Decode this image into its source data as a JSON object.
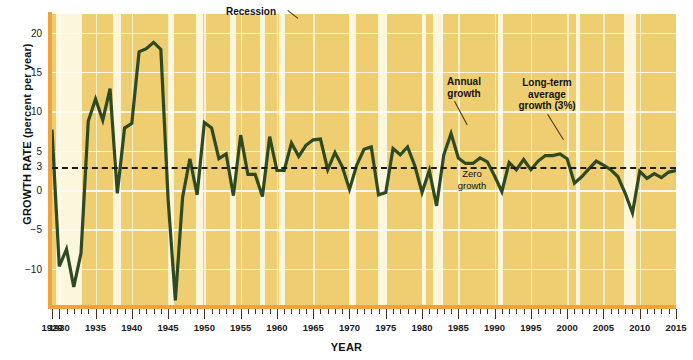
{
  "chart_data": {
    "type": "line",
    "title": "",
    "xlabel": "YEAR",
    "ylabel": "GROWTH RATE (percent per year)",
    "xlim": [
      1929,
      2015
    ],
    "ylim": [
      -14.5,
      22.5
    ],
    "ytick_values": [
      20,
      15,
      10,
      5,
      3,
      0,
      -5,
      -10
    ],
    "ytick_labels": [
      "20",
      "15",
      "10",
      "5",
      "3",
      "0",
      "−5",
      "−10"
    ],
    "xtick_labels": [
      "1929",
      "1930",
      "1935",
      "1940",
      "1945",
      "1950",
      "1955",
      "1960",
      "1965",
      "1970",
      "1975",
      "1980",
      "1985",
      "1990",
      "1995",
      "2000",
      "2005",
      "2010",
      "2015"
    ],
    "xtick_values": [
      1929,
      1930,
      1935,
      1940,
      1945,
      1950,
      1955,
      1960,
      1965,
      1970,
      1975,
      1980,
      1985,
      1990,
      1995,
      2000,
      2005,
      2010,
      2015
    ],
    "grid": true,
    "legend_position": "none",
    "reference_line": {
      "label": "Long-term average growth (3%)",
      "value": 3,
      "style": "dashed",
      "color": "#1c1c10"
    },
    "zero_line": {
      "label": "Zero growth",
      "value": 0
    },
    "series": [
      {
        "name": "Annual growth",
        "color": "#2d4a22",
        "x": [
          1929,
          1930,
          1931,
          1932,
          1933,
          1934,
          1935,
          1936,
          1937,
          1938,
          1939,
          1940,
          1941,
          1942,
          1943,
          1944,
          1945,
          1946,
          1947,
          1948,
          1949,
          1950,
          1951,
          1952,
          1953,
          1954,
          1955,
          1956,
          1957,
          1958,
          1959,
          1960,
          1961,
          1962,
          1963,
          1964,
          1965,
          1966,
          1967,
          1968,
          1969,
          1970,
          1971,
          1972,
          1973,
          1974,
          1975,
          1976,
          1977,
          1978,
          1979,
          1980,
          1981,
          1982,
          1983,
          1984,
          1985,
          1986,
          1987,
          1988,
          1989,
          1990,
          1991,
          1992,
          1993,
          1994,
          1995,
          1996,
          1997,
          1998,
          1999,
          2000,
          2001,
          2002,
          2003,
          2004,
          2005,
          2006,
          2007,
          2008,
          2009,
          2010,
          2011,
          2012,
          2013,
          2014,
          2015
        ],
        "y": [
          7.8,
          -9.6,
          -7.4,
          -12.2,
          -7.9,
          8.9,
          11.7,
          9.0,
          13.0,
          -0.3,
          8.0,
          8.6,
          17.7,
          18.1,
          18.9,
          18.0,
          -1.0,
          -13.9,
          -0.8,
          4.1,
          -0.5,
          8.7,
          8.0,
          4.1,
          4.7,
          -0.6,
          7.1,
          2.1,
          2.1,
          -0.7,
          6.9,
          2.6,
          2.6,
          6.1,
          4.4,
          5.8,
          6.5,
          6.6,
          2.7,
          4.9,
          3.1,
          0.2,
          3.3,
          5.3,
          5.6,
          -0.5,
          -0.2,
          5.4,
          4.6,
          5.6,
          3.2,
          -0.2,
          2.6,
          -1.9,
          4.6,
          7.3,
          4.2,
          3.5,
          3.5,
          4.2,
          3.7,
          1.9,
          -0.1,
          3.6,
          2.7,
          4.0,
          2.7,
          3.8,
          4.5,
          4.5,
          4.7,
          4.1,
          1.0,
          1.8,
          2.8,
          3.8,
          3.3,
          2.7,
          1.8,
          -0.3,
          -2.8,
          2.5,
          1.6,
          2.2,
          1.7,
          2.4,
          2.6
        ]
      }
    ],
    "recession_bands": [
      [
        1929.6,
        1933.2
      ],
      [
        1937.4,
        1938.5
      ],
      [
        1945.1,
        1945.8
      ],
      [
        1948.9,
        1949.8
      ],
      [
        1953.5,
        1954.4
      ],
      [
        1957.6,
        1958.3
      ],
      [
        1960.3,
        1961.1
      ],
      [
        1969.9,
        1970.9
      ],
      [
        1973.9,
        1975.2
      ],
      [
        1980.0,
        1980.5
      ],
      [
        1981.5,
        1982.9
      ],
      [
        1990.5,
        1991.2
      ],
      [
        2001.2,
        2001.8
      ],
      [
        2007.9,
        2009.5
      ]
    ],
    "band_color": "#fcf6dd"
  },
  "annotations": {
    "recession": "Recession",
    "annual_growth": "Annual\ngrowth",
    "long_term": "Long-term\naverage\ngrowth (3%)",
    "zero_growth": "Zero\ngrowth"
  },
  "colors": {
    "plot_background": "#efce72",
    "band": "#fcf6dd",
    "line": "#2d4a22",
    "spine": "#f0a33a",
    "grid": "#fdfbef",
    "text": "#111111"
  }
}
